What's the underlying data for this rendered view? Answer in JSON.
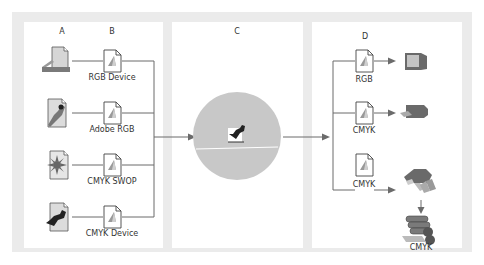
{
  "diagram": {
    "title": "",
    "columns": {
      "a": "A",
      "b": "B",
      "c": "C",
      "d": "D"
    },
    "sources": [
      {
        "device": "scanner",
        "profile": "RGB Device"
      },
      {
        "device": "rgb-image",
        "profile": "Adobe RGB"
      },
      {
        "device": "swop-image",
        "profile": "CMYK SWOP"
      },
      {
        "device": "cmyk-image",
        "profile": "CMYK Device"
      }
    ],
    "center": {
      "label": "Profile Connection Space"
    },
    "outputs": [
      {
        "profile": "RGB",
        "device": "monitor"
      },
      {
        "profile": "CMYK",
        "device": "desktop-printer"
      },
      {
        "profile": "CMYK",
        "device": "proof-printer"
      }
    ],
    "press": {
      "label": "CMYK",
      "device": "printing-press"
    },
    "colors": {
      "frame": "#ebebeb",
      "panel": "#ffffff",
      "line": "#6b6b6b",
      "circle": "#c8c8c8",
      "device": "#6a6a6a",
      "text": "#333333"
    }
  }
}
